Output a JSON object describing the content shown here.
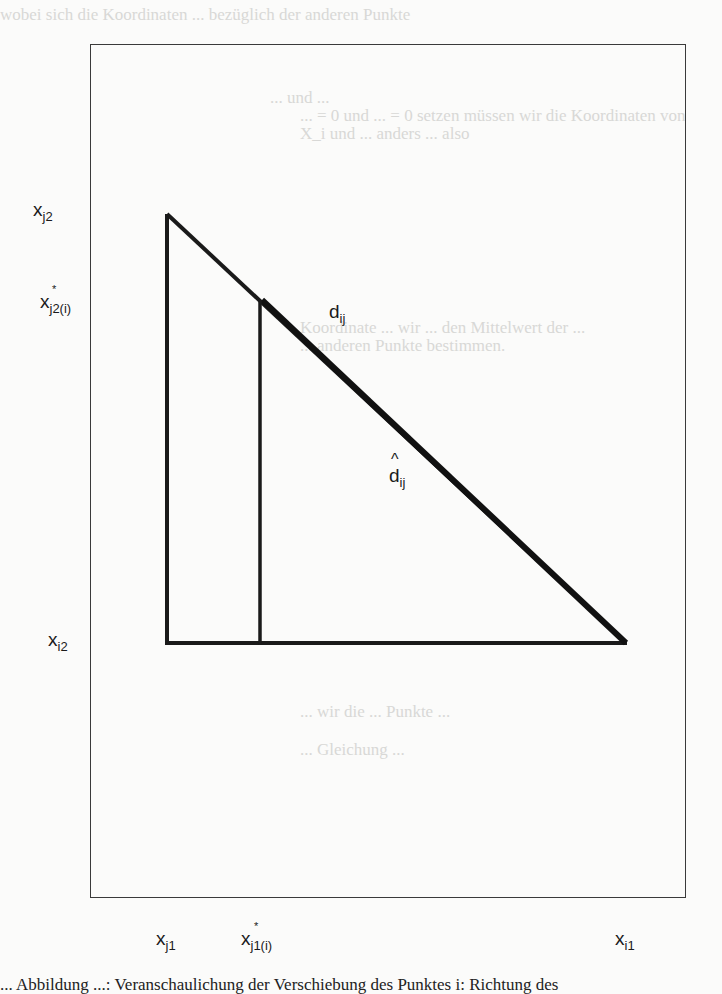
{
  "figure": {
    "type": "geometric-diagram",
    "frame": {
      "left": 90,
      "top": 44,
      "right": 686,
      "bottom": 898
    },
    "lines": {
      "left_vertical": {
        "x": 167,
        "y1": 214,
        "y2": 643
      },
      "base": {
        "x1": 167,
        "x2": 626,
        "y": 643
      },
      "hypotenuse": {
        "x1": 167,
        "y1": 214,
        "x2": 626,
        "y2": 643
      },
      "inner_vertical": {
        "x": 260,
        "y1": 301,
        "y2": 643
      }
    },
    "labels": {
      "y_top": {
        "base": "x",
        "sub": "j2"
      },
      "y_mid": {
        "base": "x",
        "sub": "j2(i)",
        "star": "*"
      },
      "y_bottom": {
        "base": "x",
        "sub": "i2"
      },
      "x_left": {
        "base": "x",
        "sub": "j1"
      },
      "x_mid": {
        "base": "x",
        "sub": "j1(i)",
        "star": "*"
      },
      "x_right": {
        "base": "x",
        "sub": "i1"
      },
      "d": {
        "base": "d",
        "sub": "ij"
      },
      "d_hat": {
        "base": "d",
        "sub": "ij",
        "hat": "^"
      }
    }
  },
  "bleed_through": {
    "line1": "wobei sich die Koordinaten ... bezüglich der anderen Punkte",
    "line2": "... und ...",
    "line3": "... = 0 und ... = 0 setzen müssen wir die Koordinaten von",
    "line4": "X_i und ... anders ... also",
    "line5": "Koordinate ... wir ... den Mittelwert der ...",
    "line6": "... anderen Punkte bestimmen.",
    "line7": "... wir die ... Punkte ...",
    "line8": "... Gleichung ..."
  },
  "caption": {
    "text": "... Abbildung ...: Veranschaulichung der Verschiebung des Punktes i: Richtung des"
  }
}
